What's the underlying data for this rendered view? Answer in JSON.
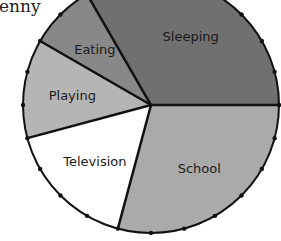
{
  "chart_data": {
    "type": "pie",
    "title": "enny",
    "unit": "hours",
    "categories": [
      "Sleeping",
      "School",
      "Television",
      "Playing",
      "Eating"
    ],
    "values": [
      8,
      7,
      4,
      3,
      2
    ],
    "total": 24,
    "colors": [
      "#707070",
      "#aaaaaa",
      "#ffffff",
      "#b5b5b5",
      "#888888"
    ],
    "tick_marks": 24,
    "start_angle_deg": 330
  }
}
